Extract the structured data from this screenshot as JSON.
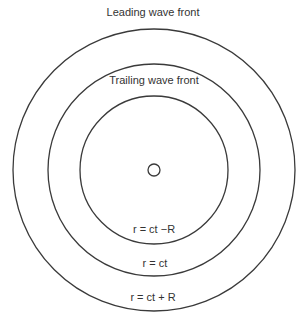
{
  "diagram": {
    "center": {
      "x": 154,
      "y": 170
    },
    "circles": [
      {
        "name": "leading",
        "r": 141
      },
      {
        "name": "middle",
        "r": 106
      },
      {
        "name": "trailing",
        "r": 74
      }
    ],
    "source_radius": 6,
    "labels": {
      "leading": "Leading wave front",
      "trailing": "Trailing wave front",
      "inner": "r = ct −R",
      "middle": "r = ct",
      "outer": "r = ct + R"
    },
    "stroke_color": "#3a3a3a"
  }
}
